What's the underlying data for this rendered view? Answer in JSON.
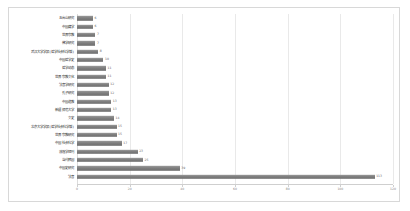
{
  "chart_data": {
    "type": "bar",
    "orientation": "horizontal",
    "title": "",
    "subtitle": "",
    "xlabel": "",
    "ylabel": "",
    "xlim": [
      0,
      120
    ],
    "grid": true,
    "legend": false,
    "legend_position": "none",
    "bar_color": "#848484",
    "background_color": "#ffffff",
    "border_color": "#d8d8d8",
    "xticks": [
      0,
      20,
      40,
      60,
      80,
      100,
      120
    ],
    "xtick_labels": [
      "0",
      "20",
      "40",
      "60",
      "80",
      "100",
      "120"
    ],
    "categories": [
      "五台山研究",
      "中国藏学",
      "世界宗教",
      "佛学研究",
      "武汉大学学报(哲学社会科学版)",
      "中国哲学史",
      "哲学动态",
      "世界宗教文化",
      "法音学研究",
      "孔子研究",
      "中国道教",
      "新疆师范大学",
      "文史",
      "北京大学学报(哲学社会科学版)",
      "世界宗教研究",
      "中国社会科学",
      "敦煌学辑刊",
      "当代韩国",
      "中国史研究",
      "法音"
    ],
    "values": [
      6,
      6,
      7,
      7,
      8,
      10,
      11,
      11,
      12,
      12,
      13,
      13,
      14,
      15,
      15,
      17,
      23,
      25,
      39,
      113
    ],
    "value_labels": [
      "6",
      "6",
      "7",
      "7",
      "8",
      "10",
      "11",
      "11",
      "12",
      "12",
      "13",
      "13",
      "14",
      "15",
      "15",
      "17",
      "23",
      "25",
      "39",
      "113"
    ]
  }
}
